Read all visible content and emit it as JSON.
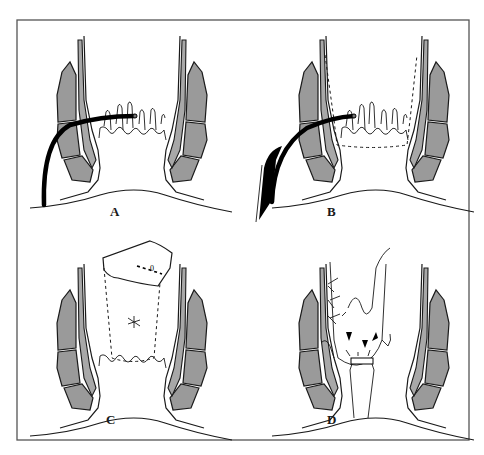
{
  "figure": {
    "frame": {
      "x": 17,
      "y": 20,
      "width": 452,
      "height": 420,
      "stroke": "#555555"
    },
    "colors": {
      "muscle_fill": "#9a9a9a",
      "wall_fill": "#a8a8a8",
      "line": "#1a1a1a",
      "background": "#ffffff"
    },
    "panels": [
      {
        "id": "A",
        "label": "A",
        "offset_x": 0,
        "offset_y": 0,
        "content": "catheter/instrument inserted through perianal skin into rectal mucosa"
      },
      {
        "id": "B",
        "label": "B",
        "offset_x": 242,
        "offset_y": 0,
        "content": "instrument in place with dashed outline of mucosal flap"
      },
      {
        "id": "C",
        "label": "C",
        "offset_x": 0,
        "offset_y": 228,
        "content": "mucosal flap lifted with dashed outline and suture mark"
      },
      {
        "id": "D",
        "label": "D",
        "offset_x": 242,
        "offset_y": 228,
        "content": "flap sutured with arrows indicating compression and drain tube"
      }
    ]
  }
}
